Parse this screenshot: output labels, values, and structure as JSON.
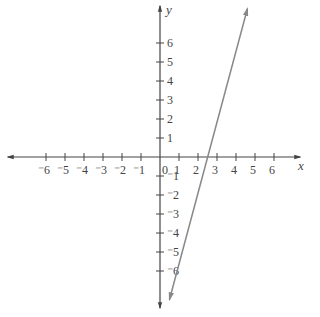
{
  "chart_data": {
    "type": "line",
    "title": "",
    "xlabel": "x",
    "ylabel": "y",
    "xlim": [
      -7.5,
      7.5
    ],
    "ylim": [
      -8,
      8
    ],
    "grid": false,
    "x_ticks": [
      -6,
      -5,
      -4,
      -3,
      -2,
      -1,
      1,
      2,
      3,
      4,
      5,
      6
    ],
    "x_tick_labels": [
      "⁻6",
      "⁻5",
      "⁻4",
      "⁻3",
      "⁻2",
      "⁻1",
      "1",
      "2",
      "3",
      "4",
      "5",
      "6"
    ],
    "y_ticks": [
      -6,
      -5,
      -4,
      -3,
      -2,
      -1,
      1,
      2,
      3,
      4,
      5,
      6
    ],
    "y_tick_labels": [
      "⁻6",
      "⁻5",
      "⁻4",
      "⁻3",
      "⁻2",
      "⁻1",
      "1",
      "2",
      "3",
      "4",
      "5",
      "6"
    ],
    "origin_label": "0",
    "series": [
      {
        "name": "y = 3x - 6",
        "slope": 3,
        "intercept": -6,
        "x": [
          0.5,
          4.6
        ],
        "y": [
          -7.5,
          7.8
        ],
        "color": "#888888"
      }
    ]
  },
  "colors": {
    "axis": "#444444",
    "line": "#888888"
  }
}
